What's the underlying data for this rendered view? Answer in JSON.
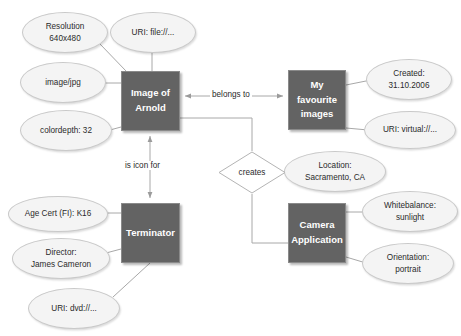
{
  "diagram": {
    "colors": {
      "entity_fill": "#636363",
      "entity_text": "#ffffff",
      "attribute_fill": "#f4f4f4",
      "attribute_border": "#c9c9c9",
      "edge": "#a0a0a0",
      "background": "#ffffff"
    },
    "entities": [
      {
        "id": "image-of-arnold",
        "label": "Image of\nArnold",
        "x": 121,
        "y": 71,
        "w": 59,
        "h": 60
      },
      {
        "id": "my-favourite-images",
        "label": "My favourite\nimages",
        "x": 288,
        "y": 70,
        "w": 58,
        "h": 60
      },
      {
        "id": "terminator",
        "label": "Terminator",
        "x": 121,
        "y": 203,
        "w": 59,
        "h": 60
      },
      {
        "id": "camera-application",
        "label": "Camera\nApplication",
        "x": 288,
        "y": 203,
        "w": 58,
        "h": 60
      }
    ],
    "relationship": {
      "id": "creates",
      "label": "creates",
      "x": 218,
      "y": 151,
      "w": 68,
      "h": 43
    },
    "attributes": [
      {
        "id": "resolution",
        "label": "Resolution\n640x480",
        "x": 22,
        "y": 12,
        "w": 86,
        "h": 41
      },
      {
        "id": "uri-file",
        "label": "URI: file://...",
        "x": 110,
        "y": 12,
        "w": 86,
        "h": 41
      },
      {
        "id": "image-jpg",
        "label": "image/jpg",
        "x": 20,
        "y": 62,
        "w": 86,
        "h": 41
      },
      {
        "id": "colordepth",
        "label": "colordepth: 32",
        "x": 20,
        "y": 110,
        "w": 92,
        "h": 41
      },
      {
        "id": "created",
        "label": "Created:\n31.10.2006",
        "x": 366,
        "y": 59,
        "w": 86,
        "h": 41
      },
      {
        "id": "uri-virtual",
        "label": "URI: virtual://...",
        "x": 364,
        "y": 111,
        "w": 92,
        "h": 38
      },
      {
        "id": "location",
        "label": "Location:\nSacramento, CA",
        "x": 284,
        "y": 151,
        "w": 102,
        "h": 41
      },
      {
        "id": "whitebalance",
        "label": "Whitebalance:\nsunlight",
        "x": 362,
        "y": 191,
        "w": 96,
        "h": 41
      },
      {
        "id": "orientation",
        "label": "Orientation:\nportrait",
        "x": 362,
        "y": 243,
        "w": 92,
        "h": 41
      },
      {
        "id": "age-cert",
        "label": "Age Cert (FI): K16",
        "x": 8,
        "y": 196,
        "w": 100,
        "h": 36
      },
      {
        "id": "director",
        "label": "Director:\nJames Cameron",
        "x": 12,
        "y": 238,
        "w": 98,
        "h": 41
      },
      {
        "id": "uri-dvd",
        "label": "URI: dvd://...",
        "x": 28,
        "y": 288,
        "w": 92,
        "h": 41
      }
    ],
    "edge_labels": [
      {
        "id": "belongs-to",
        "label": "belongs to",
        "x": 210,
        "y": 92
      },
      {
        "id": "is-icon-for",
        "label": "is icon for",
        "x": 123,
        "y": 162
      }
    ]
  }
}
